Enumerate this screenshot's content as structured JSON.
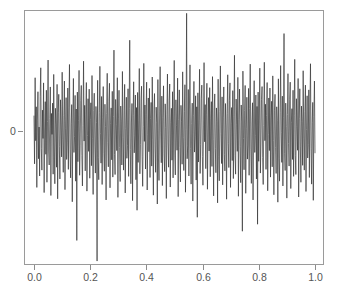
{
  "figure": {
    "title": "",
    "background_color": "#ffffff",
    "width": 337,
    "height": 302
  },
  "axes": {
    "box_color": "#9a9a9a",
    "tick_color": "#8c8c8c",
    "label_color": "#555555",
    "plot_left": 24,
    "plot_top": 10,
    "plot_right": 323,
    "plot_bottom": 264
  },
  "chart_data": {
    "type": "line",
    "title": "",
    "subtitle": "",
    "xlabel": "",
    "ylabel": "",
    "grid": false,
    "legend": [],
    "legend_position": "none",
    "series_color": "#2b2b2b",
    "xlim": [
      0.0,
      1.0
    ],
    "ylim": [
      -3.6,
      3.3
    ],
    "x_tick_labels": [
      "0.0",
      "0.2",
      "0.4",
      "0.6",
      "0.8",
      "1.0"
    ],
    "x_tick_values": [
      0.0,
      0.2,
      0.4,
      0.6,
      0.8,
      1.0
    ],
    "y_tick_labels": [
      "0"
    ],
    "y_tick_values": [
      0
    ],
    "x_start": 0.0,
    "x_end": 1.0,
    "n_points": 500,
    "annotations": [],
    "series": [
      {
        "name": "white-noise",
        "values": [
          0.42,
          -0.88,
          1.46,
          -0.25,
          0.67,
          -1.52,
          0.31,
          1.08,
          -0.74,
          0.12,
          -1.21,
          0.95,
          1.73,
          -0.46,
          -1.05,
          0.58,
          -0.19,
          1.32,
          -1.66,
          0.04,
          0.81,
          -0.62,
          1.12,
          -1.38,
          0.27,
          1.94,
          -0.53,
          -0.91,
          0.36,
          1.21,
          -1.74,
          0.49,
          -0.08,
          0.77,
          -1.16,
          1.55,
          -0.34,
          -1.42,
          0.63,
          0.18,
          -0.97,
          1.28,
          -1.83,
          0.52,
          1.01,
          -0.41,
          -1.29,
          0.86,
          0.15,
          -0.69,
          1.61,
          -0.23,
          -1.11,
          0.44,
          1.37,
          -1.58,
          0.07,
          0.92,
          -0.76,
          -0.31,
          1.18,
          -1.03,
          0.66,
          1.82,
          -0.48,
          -1.26,
          0.21,
          0.73,
          -1.91,
          0.39,
          1.44,
          -0.57,
          -0.14,
          0.98,
          -1.35,
          0.61,
          -2.96,
          1.07,
          -0.82,
          0.29,
          1.66,
          -1.19,
          -0.37,
          0.84,
          1.25,
          -0.65,
          -1.48,
          0.16,
          1.91,
          -0.26,
          0.71,
          -1.07,
          0.45,
          1.33,
          -1.62,
          -0.11,
          0.89,
          -0.54,
          1.15,
          -1.27,
          0.33,
          0.78,
          -0.93,
          1.52,
          -0.18,
          -1.71,
          0.57,
          1.04,
          -0.42,
          -1.13,
          0.68,
          0.24,
          -3.52,
          1.39,
          -0.71,
          -1.31,
          0.51,
          1.77,
          -0.06,
          -0.86,
          0.95,
          -1.44,
          0.37,
          1.22,
          -0.59,
          -1.08,
          0.74,
          0.13,
          -1.86,
          0.48,
          1.58,
          -0.29,
          -0.96,
          0.82,
          1.31,
          -1.53,
          0.22,
          0.64,
          -0.77,
          1.09,
          -1.24,
          0.41,
          2.21,
          -0.63,
          -1.17,
          0.87,
          0.19,
          -0.52,
          1.46,
          -1.79,
          0.34,
          1.12,
          -0.44,
          -1.36,
          0.69,
          0.26,
          -0.91,
          1.63,
          -0.17,
          -1.05,
          0.56,
          1.28,
          -1.67,
          0.08,
          0.93,
          -0.73,
          -0.38,
          1.16,
          -1.22,
          0.62,
          2.48,
          -0.49,
          -1.42,
          0.23,
          0.76,
          -1.88,
          0.43,
          1.35,
          -0.58,
          -0.12,
          0.99,
          -1.31,
          0.65,
          -2.14,
          1.06,
          -0.84,
          0.31,
          1.71,
          -1.15,
          -0.36,
          0.88,
          1.23,
          -0.67,
          -1.49,
          0.14,
          1.85,
          -0.27,
          0.72,
          -1.02,
          0.46,
          1.34,
          -1.59,
          -0.09,
          0.91,
          -0.55,
          1.17,
          -1.25,
          0.35,
          0.79,
          -0.94,
          1.48,
          -0.21,
          -1.73,
          0.59,
          1.03,
          -0.45,
          -1.11,
          0.66,
          0.25,
          -1.97,
          1.41,
          -0.72,
          -1.33,
          0.53,
          1.76,
          -0.04,
          -0.85,
          0.96,
          -1.47,
          0.38,
          1.24,
          -0.61,
          -1.09,
          0.75,
          0.11,
          -1.82,
          0.47,
          1.56,
          -0.31,
          -0.97,
          0.83,
          1.29,
          -1.51,
          0.24,
          0.63,
          -0.78,
          1.08,
          -1.26,
          0.42,
          1.93,
          -0.64,
          -1.18,
          0.86,
          0.17,
          -0.51,
          1.45,
          -1.77,
          0.32,
          1.13,
          -0.43,
          -1.37,
          0.71,
          0.28,
          -0.89,
          1.62,
          -0.16,
          -1.06,
          0.54,
          1.27,
          -1.65,
          0.06,
          3.21,
          -0.74,
          -0.39,
          1.14,
          -1.21,
          0.61,
          1.81,
          -0.47,
          -1.43,
          0.22,
          0.77,
          -1.89,
          0.44,
          1.36,
          -0.56,
          -0.13,
          0.97,
          -1.32,
          0.67,
          -2.33,
          1.05,
          -0.83,
          0.29,
          1.69,
          -1.14,
          -0.35,
          0.89,
          1.26,
          -0.68,
          -1.46,
          0.15,
          1.87,
          -0.28,
          0.73,
          -1.01,
          0.45,
          1.31,
          -1.57,
          -0.07,
          0.92,
          -0.53,
          1.19,
          -1.23,
          0.36,
          0.81,
          -0.95,
          1.49,
          -0.22,
          -1.75,
          0.58,
          1.02,
          -0.46,
          -1.12,
          0.64,
          0.27,
          -1.94,
          1.42,
          -0.69,
          -1.34,
          0.55,
          1.78,
          -0.05,
          -0.87,
          0.94,
          -1.45,
          0.37,
          1.21,
          -0.62,
          -1.07,
          0.76,
          0.12,
          -1.84,
          0.49,
          1.54,
          -0.32,
          -0.98,
          0.85,
          1.32,
          -1.52,
          0.21,
          0.65,
          -0.79,
          1.11,
          -1.28,
          0.41,
          2.07,
          -0.66,
          -1.16,
          0.88,
          0.18,
          -0.54,
          1.47,
          -1.76,
          0.33,
          1.15,
          -0.41,
          -1.39,
          0.72,
          0.26,
          -2.71,
          1.64,
          -0.19,
          -1.04,
          0.57,
          1.25,
          -1.68,
          0.09,
          0.93,
          -0.75,
          -0.37,
          1.17,
          -1.19,
          0.63,
          1.83,
          -0.48,
          -1.41,
          0.23,
          0.78,
          -1.86,
          0.42,
          1.38,
          -0.57,
          -0.11,
          0.99,
          -1.29,
          0.68,
          -2.52,
          1.07,
          -0.81,
          0.31,
          1.72,
          -1.13,
          -0.34,
          0.87,
          1.22,
          -0.71,
          -1.44,
          0.16,
          1.88,
          -0.25,
          0.74,
          -1.03,
          0.43,
          1.33,
          -1.61,
          -0.08,
          0.91,
          -0.52,
          1.18,
          -1.24,
          0.34,
          0.82,
          -0.96,
          1.51,
          -0.24,
          -1.72,
          0.56,
          1.01,
          -0.44,
          -1.14,
          0.67,
          0.29,
          -1.92,
          1.43,
          -0.73,
          -1.35,
          0.52,
          1.79,
          -0.03,
          -0.84,
          0.96,
          -1.48,
          0.39,
          2.66,
          -0.59,
          -1.06,
          0.77,
          0.14,
          -1.81,
          0.46,
          1.57,
          -0.33,
          -0.94,
          0.86,
          1.34,
          -1.55,
          0.25,
          0.62,
          -0.76,
          1.12,
          -1.22,
          0.44,
          1.96,
          -0.65,
          -1.17,
          0.89,
          0.13,
          -0.51,
          1.44,
          -1.78,
          0.35,
          1.16,
          -0.42,
          -1.38,
          0.69,
          0.27,
          -0.92,
          1.65,
          -0.18,
          -1.05,
          0.55,
          1.26,
          -1.63,
          0.05,
          0.97,
          -0.72,
          -0.36,
          1.13,
          -1.25,
          0.64,
          1.84,
          -0.47,
          -1.43,
          0.24,
          0.79,
          -1.87,
          0.41,
          1.37,
          -0.58
        ]
      }
    ]
  }
}
